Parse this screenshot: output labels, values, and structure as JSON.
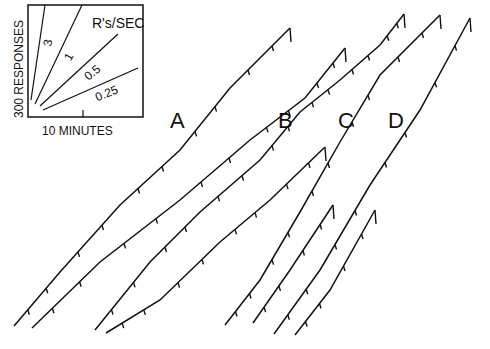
{
  "figure": {
    "type": "cumulative_record",
    "inset": {
      "ylabel": "300 RESPONSES",
      "xlabel": "10 MINUTES",
      "rate_title": "R's/SEC",
      "rates": [
        "3",
        "1",
        "0.5",
        "0.25"
      ]
    },
    "panel_labels": [
      "A",
      "B",
      "C",
      "D"
    ]
  },
  "chart_data": {
    "type": "line",
    "title": "",
    "xlabel": "10 MINUTES",
    "ylabel": "300 RESPONSES",
    "legend": {
      "title": "R's/SEC",
      "slopes": [
        3,
        1,
        0.5,
        0.25
      ]
    },
    "grid": false,
    "series": [
      {
        "name": "A (segment 1)",
        "points": [
          [
            14,
            326
          ],
          [
            60,
            272
          ],
          [
            120,
            205
          ],
          [
            180,
            150
          ],
          [
            230,
            88
          ],
          [
            290,
            28
          ]
        ]
      },
      {
        "name": "A (segment 2)",
        "points": [
          [
            32,
            328
          ],
          [
            100,
            262
          ],
          [
            180,
            200
          ],
          [
            250,
            140
          ],
          [
            305,
            98
          ],
          [
            345,
            48
          ]
        ]
      },
      {
        "name": "B (segment 1)",
        "points": [
          [
            95,
            330
          ],
          [
            150,
            262
          ],
          [
            200,
            212
          ],
          [
            260,
            160
          ],
          [
            300,
            112
          ],
          [
            340,
            80
          ],
          [
            380,
            45
          ],
          [
            404,
            14
          ]
        ]
      },
      {
        "name": "B (segment 2)",
        "points": [
          [
            106,
            333
          ],
          [
            160,
            300
          ],
          [
            220,
            242
          ],
          [
            270,
            200
          ],
          [
            325,
            147
          ]
        ]
      },
      {
        "name": "C (segment 1)",
        "points": [
          [
            225,
            325
          ],
          [
            260,
            280
          ],
          [
            300,
            212
          ],
          [
            340,
            142
          ],
          [
            380,
            75
          ],
          [
            440,
            15
          ]
        ]
      },
      {
        "name": "C (segment 2)",
        "points": [
          [
            253,
            323
          ],
          [
            290,
            270
          ],
          [
            333,
            205
          ]
        ]
      },
      {
        "name": "D (segment 1)",
        "points": [
          [
            274,
            334
          ],
          [
            320,
            270
          ],
          [
            370,
            185
          ],
          [
            420,
            110
          ],
          [
            470,
            18
          ]
        ]
      },
      {
        "name": "D (segment 2)",
        "points": [
          [
            295,
            335
          ],
          [
            330,
            290
          ],
          [
            375,
            210
          ]
        ]
      }
    ]
  }
}
